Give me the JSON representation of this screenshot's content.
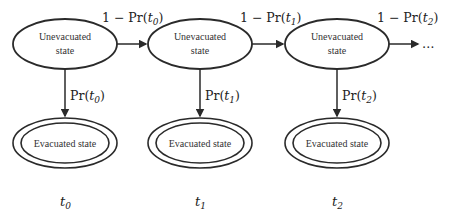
{
  "diagram": {
    "type": "markov-chain",
    "stages": [
      {
        "time_label": "t",
        "time_sub": "0",
        "unevacuated_line1": "Unevacuated",
        "unevacuated_line2": "state",
        "evacuated_label": "Evacuated state",
        "down_prefix": "Pr(",
        "down_var": "t",
        "down_sub": "0",
        "down_suffix": ")",
        "right_prefix": "1 − Pr(",
        "right_var": "t",
        "right_sub": "0",
        "right_suffix": ")"
      },
      {
        "time_label": "t",
        "time_sub": "1",
        "unevacuated_line1": "Unevacuated",
        "unevacuated_line2": "state",
        "evacuated_label": "Evacuated state",
        "down_prefix": "Pr(",
        "down_var": "t",
        "down_sub": "1",
        "down_suffix": ")",
        "right_prefix": "1 − Pr(",
        "right_var": "t",
        "right_sub": "1",
        "right_suffix": ")"
      },
      {
        "time_label": "t",
        "time_sub": "2",
        "unevacuated_line1": "Unevacuated",
        "unevacuated_line2": "state",
        "evacuated_label": "Evacuated state",
        "down_prefix": "Pr(",
        "down_var": "t",
        "down_sub": "2",
        "down_suffix": ")",
        "right_prefix": "1 − Pr(",
        "right_var": "t",
        "right_sub": "2",
        "right_suffix": ")"
      }
    ],
    "continuation": "…",
    "colors": {
      "stroke": "#2a2a2a",
      "text": "#333333"
    }
  }
}
